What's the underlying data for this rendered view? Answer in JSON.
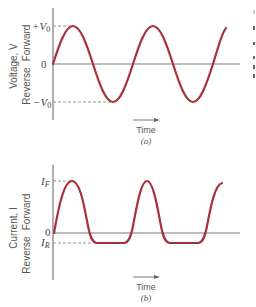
{
  "panel_a": {
    "ylabel": "Voltage, V",
    "direction_forward": "Forward",
    "direction_reverse": "Reverse",
    "tick_pos": "+V",
    "tick_pos_sub": "0",
    "tick_zero": "0",
    "tick_neg": "−V",
    "tick_neg_sub": "0",
    "time_label": "Time",
    "caption": "(a)"
  },
  "panel_b": {
    "ylabel": "Current, I",
    "direction_forward": "Forward",
    "direction_reverse": "Reverse",
    "tick_pos": "I",
    "tick_pos_sub": "F",
    "tick_zero": "0",
    "tick_neg": "I",
    "tick_neg_sub": "R",
    "time_label": "Time",
    "caption": "(b)"
  },
  "colors": {
    "curve": "#a8323c",
    "axis": "#7a7a7a",
    "text": "#555555"
  }
}
